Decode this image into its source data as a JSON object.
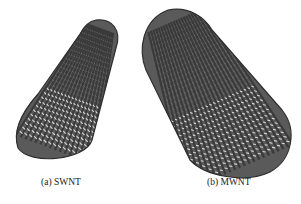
{
  "figure": {
    "panels": [
      {
        "id": "a",
        "caption": "(a) SWNT",
        "subject": "single-walled carbon nanotube illustration"
      },
      {
        "id": "b",
        "caption": "(b) MWNT",
        "subject": "multi-walled carbon nanotube illustration"
      }
    ],
    "colors": {
      "tube_dark": "#3a3a3a",
      "tube_mid": "#6e6e6e",
      "tube_light": "#d8d8d8",
      "background": "#ffffff"
    }
  }
}
